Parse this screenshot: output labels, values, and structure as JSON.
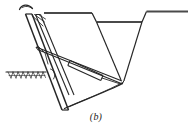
{
  "figure": {
    "caption": "(b)",
    "type": "technical-line-diagram",
    "stroke_color": "#262626",
    "accent_color": "#3a3a3a",
    "background_color": "#ffffff",
    "canvas": {
      "width": 192,
      "height": 135
    },
    "parts": [
      {
        "name": "ground-line",
        "label": "Ground surface",
        "path": "M 6 72 L 46 72",
        "stroke_width": 1.1
      },
      {
        "name": "ground-hatching",
        "label": "Soil hatching",
        "stroke_width": 0.7,
        "ticks": [
          "M 8 72 L 11 79",
          "M 13 72 L 16 79",
          "M 18 72 L 21 79",
          "M 23 72 L 26 79",
          "M 28 72 L 31 79",
          "M 33 72 L 36 79",
          "M 38 72 L 41 79",
          "M 43 72 L 46 79",
          "M 11 79 L 13 72",
          "M 16 79 L 18 72",
          "M 21 79 L 23 72",
          "M 26 79 L 28 72",
          "M 31 79 L 33 72",
          "M 36 79 L 38 72",
          "M 41 79 L 43 72",
          "M 7 77 L 45 77"
        ]
      },
      {
        "name": "ground-surface-left",
        "label": "Left ground surface top",
        "path": "M 44 13 L 92 13",
        "stroke_width": 1.6
      },
      {
        "name": "trench-wall-left",
        "label": "Trench left sloping wall",
        "path": "M 92 13 L 96 22",
        "stroke_width": 1.3
      },
      {
        "name": "trench-bench",
        "label": "Trench bench / berm",
        "path": "M 96 22 L 142 22",
        "stroke_width": 1.6
      },
      {
        "name": "trench-wall-inner-left",
        "label": "Trench inner left wall",
        "path": "M 96 22 L 121 80",
        "stroke_width": 1.2
      },
      {
        "name": "trench-wall-inner-right",
        "label": "Trench inner right wall",
        "path": "M 142 22 L 124 80",
        "stroke_width": 1.2
      },
      {
        "name": "trench-wall-right",
        "label": "Trench right sloping wall",
        "path": "M 142 22 L 146 12",
        "stroke_width": 1.3
      },
      {
        "name": "ground-surface-right",
        "label": "Right ground surface top",
        "path": "M 146 12 L 188 12",
        "stroke_width": 1.6
      },
      {
        "name": "mast-outer-edge",
        "label": "Mast / leader outer edge",
        "path": "M 26 14 L 62 110",
        "stroke_width": 1.5
      },
      {
        "name": "mast-inner-edge",
        "label": "Mast / leader inner edge",
        "path": "M 32 14 L 68 110",
        "stroke_width": 1.5
      },
      {
        "name": "mast-cap",
        "label": "Mast top cap",
        "path": "M 26 14 L 32 14",
        "stroke_width": 1.3
      },
      {
        "name": "mast-foot",
        "label": "Mast foot",
        "path": "M 62 110 L 68 110",
        "stroke_width": 1.3
      },
      {
        "name": "brace-outer",
        "label": "Secondary brace outer",
        "path": "M 36 14 L 69 95",
        "stroke_width": 1.2
      },
      {
        "name": "brace-inner",
        "label": "Secondary brace inner",
        "path": "M 41 14 L 74 95",
        "stroke_width": 1.2
      },
      {
        "name": "brace-cap",
        "label": "Secondary brace top cap",
        "path": "M 36 14 L 41 14",
        "stroke_width": 1.1
      },
      {
        "name": "head-diagonal-a",
        "label": "Head gusset diagonal A",
        "path": "M 32 15 L 43 25",
        "stroke_width": 0.9
      },
      {
        "name": "head-diagonal-b",
        "label": "Head gusset diagonal B",
        "path": "M 35 14 L 45 21",
        "stroke_width": 0.9
      },
      {
        "name": "head-hook",
        "label": "Cable hook / sheave",
        "path": "M 20 8 C 24 3, 31 4, 33 10",
        "stroke_width": 1.2
      },
      {
        "name": "head-hook-tail",
        "label": "Cable hook tail",
        "path": "M 33 10 C 31 7, 27 6, 23 8",
        "stroke_width": 1.0
      },
      {
        "name": "boom-upper-chord",
        "label": "Boom upper chord",
        "path": "M 36 47 L 122 81",
        "stroke_width": 1.2
      },
      {
        "name": "boom-lower-chord",
        "label": "Boom lower chord",
        "path": "M 37 49 L 122 84",
        "stroke_width": 1.2
      },
      {
        "name": "cylinder-barrel-top",
        "label": "Hydraulic cylinder barrel top",
        "path": "M 70 61 L 103 76",
        "stroke_width": 1.2
      },
      {
        "name": "cylinder-barrel-bottom",
        "label": "Hydraulic cylinder barrel bottom",
        "path": "M 68 66 L 101 81",
        "stroke_width": 1.2
      },
      {
        "name": "cylinder-cap-rear",
        "label": "Cylinder rear cap",
        "path": "M 70 61 L 68 66",
        "stroke_width": 1.1
      },
      {
        "name": "cylinder-cap-front",
        "label": "Cylinder front cap",
        "path": "M 103 76 L 101 81",
        "stroke_width": 1.1
      },
      {
        "name": "cylinder-rod",
        "label": "Cylinder rod",
        "path": "M 102 78 L 120 84",
        "stroke_width": 1.0
      },
      {
        "name": "pivot-bracket-upper",
        "label": "Upper pivot bracket",
        "path": "M 38 46 L 44 52",
        "stroke_width": 0.9
      },
      {
        "name": "pivot-bracket-lower",
        "label": "Lower pivot bracket",
        "path": "M 44 52 L 47 63",
        "stroke_width": 0.9
      },
      {
        "name": "mast-lug",
        "label": "Mast attachment lug",
        "path": "M 50 69 C 54 70, 55 74, 53 78",
        "stroke_width": 0.9
      },
      {
        "name": "bucket-curve",
        "label": "Bucket / cutting blade curve",
        "path": "M 65 108 C 83 99, 106 91, 122 83",
        "stroke_width": 1.3
      },
      {
        "name": "bucket-curve-inner",
        "label": "Bucket inner curve",
        "path": "M 69 106 C 86 98, 107 90, 122 82",
        "stroke_width": 0.9
      },
      {
        "name": "bucket-tip-link",
        "label": "Bucket tip link",
        "path": "M 122 83 L 124 80",
        "stroke_width": 1.0
      }
    ]
  }
}
